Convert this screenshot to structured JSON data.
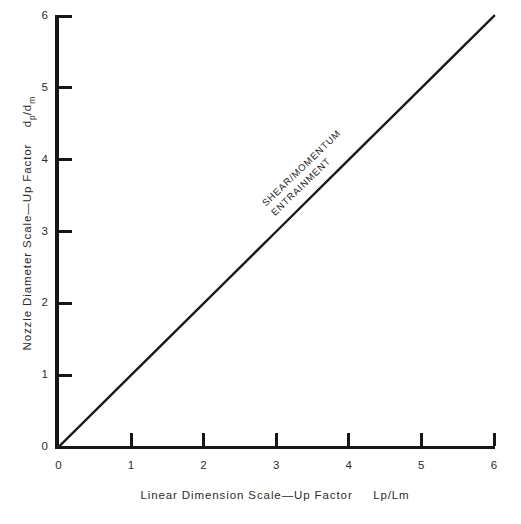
{
  "chart_data": {
    "type": "line",
    "title": "",
    "subtitle": "",
    "xlabel_parts": {
      "main": "Linear Dimension Scale—Up Factor",
      "symbol": "Lp/Lm"
    },
    "ylabel_parts": {
      "main": "Nozzle Diameter Scale—Up Factor",
      "symbol_num": "d",
      "symbol_num_sub": "p",
      "symbol_den": "d",
      "symbol_den_sub": "m"
    },
    "xlabel": "Linear Dimension Scale—Up Factor  Lp/Lm",
    "ylabel": "Nozzle Diameter Scale—Up Factor  dp/dm",
    "xlim": [
      0,
      6
    ],
    "ylim": [
      0,
      6
    ],
    "xticks": [
      "0",
      "1",
      "2",
      "3",
      "4",
      "5",
      "6"
    ],
    "yticks": [
      "0",
      "1",
      "2",
      "3",
      "4",
      "5",
      "6"
    ],
    "xtick_values": [
      0,
      1,
      2,
      3,
      4,
      5,
      6
    ],
    "ytick_values": [
      0,
      1,
      2,
      3,
      4,
      5,
      6
    ],
    "grid": false,
    "legend": false,
    "series": [
      {
        "name": "SHEAR/MOMENTUM ENTRAINMENT",
        "x": [
          0,
          1,
          2,
          3,
          4,
          5,
          6
        ],
        "values": [
          0,
          1,
          2,
          3,
          4,
          5,
          6
        ],
        "color": "#1a1a1a"
      }
    ],
    "annotations": [
      {
        "line1": "SHEAR/MOMENTUM",
        "line2": "ENTRAINMENT",
        "at_x": 3.0,
        "at_y": 3.0,
        "rotation_deg": -44
      }
    ]
  },
  "artifacts": {
    "top_left": "",
    "top_right": ""
  }
}
